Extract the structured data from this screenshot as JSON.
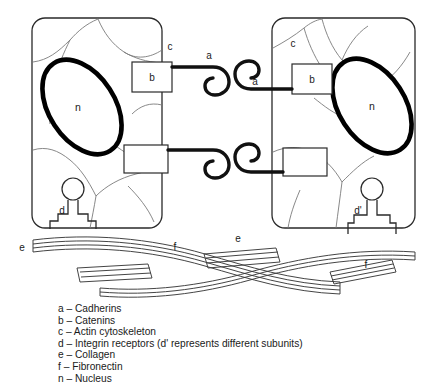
{
  "figure": {
    "cells": [
      {
        "id": "left-cell",
        "nucleus_label": "n",
        "cytoskeleton_label": "c",
        "catenin_label": "b",
        "integrin_label": "d"
      },
      {
        "id": "right-cell",
        "nucleus_label": "n",
        "cytoskeleton_label": "c",
        "catenin_label": "b",
        "integrin_label": "d'"
      }
    ],
    "junction_labels": {
      "cadherin_left": "a",
      "cadherin_right": "a"
    },
    "matrix_labels": {
      "collagen_left": "e",
      "collagen_right": "e",
      "fibronectin_left": "f",
      "fibronectin_right": "f"
    },
    "colors": {
      "ink": "#1a1a1a",
      "nucleus_outline": "#000000",
      "cytoskeleton": "#6f6f6f",
      "matrix": "#3a3a3a",
      "background": "#ffffff"
    }
  },
  "legend": {
    "items": [
      "a – Cadherins",
      "b – Catenins",
      "c – Actin cytoskeleton",
      "d – Integrin receptors (d' represents different subunits)",
      "e – Collagen",
      "f – Fibronectin",
      "n – Nucleus"
    ]
  }
}
